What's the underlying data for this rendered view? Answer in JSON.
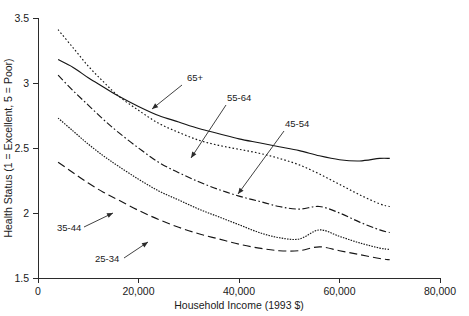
{
  "chart_data": {
    "type": "line",
    "title": "",
    "xlabel": "Household Income (1993 $)",
    "ylabel": "Health Status (1 = Excellent, 5 = Poor)",
    "xlim": [
      0,
      80000
    ],
    "ylim": [
      1.5,
      3.5
    ],
    "xticks": [
      0,
      20000,
      40000,
      60000,
      80000
    ],
    "xtick_labels": [
      "0",
      "20,000",
      "40,000",
      "60,000",
      "80,000"
    ],
    "yticks": [
      1.5,
      2,
      2.5,
      3,
      3.5
    ],
    "ytick_labels": [
      "1.5",
      "2",
      "2.5",
      "3",
      "3.5"
    ],
    "grid": false,
    "legend": "annotations-inline",
    "x": [
      4000,
      7000,
      10000,
      13000,
      16000,
      20000,
      24000,
      28000,
      32000,
      36000,
      40000,
      44000,
      48000,
      52000,
      56000,
      60000,
      64000,
      68000,
      70000
    ],
    "series": [
      {
        "name": "65+",
        "label": "65+",
        "style": "solid",
        "values": [
          3.18,
          3.12,
          3.04,
          2.97,
          2.9,
          2.82,
          2.75,
          2.7,
          2.65,
          2.61,
          2.57,
          2.54,
          2.51,
          2.48,
          2.44,
          2.41,
          2.4,
          2.42,
          2.42
        ]
      },
      {
        "name": "55-64",
        "label": "55-64",
        "style": "fine-dotted",
        "values": [
          3.41,
          3.27,
          3.13,
          3.01,
          2.9,
          2.79,
          2.69,
          2.62,
          2.56,
          2.52,
          2.49,
          2.46,
          2.42,
          2.37,
          2.3,
          2.22,
          2.14,
          2.07,
          2.05
        ]
      },
      {
        "name": "45-54",
        "label": "45-54",
        "style": "dash-dot",
        "values": [
          3.06,
          2.94,
          2.83,
          2.72,
          2.62,
          2.5,
          2.39,
          2.31,
          2.24,
          2.18,
          2.13,
          2.09,
          2.05,
          2.03,
          2.05,
          2.0,
          1.93,
          1.87,
          1.85
        ]
      },
      {
        "name": "35-44",
        "label": "35-44",
        "style": "dense-dotted",
        "values": [
          2.73,
          2.63,
          2.53,
          2.44,
          2.36,
          2.26,
          2.17,
          2.1,
          2.03,
          1.97,
          1.91,
          1.85,
          1.81,
          1.8,
          1.87,
          1.82,
          1.77,
          1.73,
          1.72
        ]
      },
      {
        "name": "25-34",
        "label": "25-34",
        "style": "long-dash",
        "values": [
          2.39,
          2.31,
          2.23,
          2.16,
          2.1,
          2.02,
          1.95,
          1.89,
          1.84,
          1.8,
          1.76,
          1.73,
          1.71,
          1.71,
          1.74,
          1.71,
          1.68,
          1.65,
          1.64
        ]
      }
    ],
    "annotations": [
      {
        "label": "65+",
        "text_x": 187,
        "text_y": 81,
        "leader": [
          [
            182,
            85
          ],
          [
            152,
            109
          ]
        ]
      },
      {
        "label": "55-64",
        "text_x": 227,
        "text_y": 101,
        "leader": [
          [
            226,
            105
          ],
          [
            191,
            158
          ]
        ]
      },
      {
        "label": "45-54",
        "text_x": 285,
        "text_y": 127,
        "leader": [
          [
            284,
            131
          ],
          [
            238,
            194
          ]
        ]
      },
      {
        "label": "35-44",
        "text_x": 57,
        "text_y": 231,
        "leader": [
          [
            84,
            227
          ],
          [
            113,
            213
          ]
        ]
      },
      {
        "label": "25-34",
        "text_x": 95,
        "text_y": 262,
        "leader": [
          [
            124,
            258
          ],
          [
            148,
            242
          ]
        ]
      }
    ]
  }
}
